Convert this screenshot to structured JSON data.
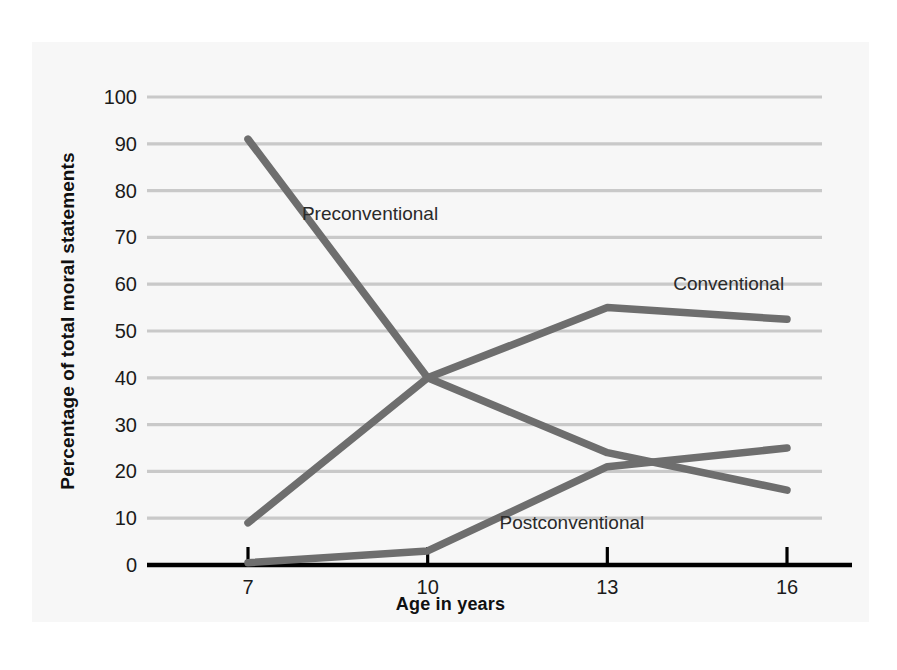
{
  "chart_data": {
    "type": "line",
    "title": "",
    "xlabel": "Age in years",
    "ylabel": "Percentage of total moral statements",
    "x": [
      7,
      10,
      13,
      16
    ],
    "xtick_labels": [
      "7",
      "10",
      "13",
      "16"
    ],
    "ytick_labels": [
      "0",
      "10",
      "20",
      "30",
      "40",
      "50",
      "60",
      "70",
      "80",
      "90",
      "100"
    ],
    "ytick_values": [
      0,
      10,
      20,
      30,
      40,
      50,
      60,
      70,
      80,
      90,
      100
    ],
    "ylim": [
      0,
      100
    ],
    "xlim": [
      7,
      16
    ],
    "grid": "horizontal",
    "legend_position": "inline-labels",
    "series": [
      {
        "name": "Preconventional",
        "values": [
          91,
          40,
          24,
          16
        ],
        "color": "#6e6e6e",
        "label_x": 7.9,
        "label_y": 75
      },
      {
        "name": "Conventional",
        "values": [
          9,
          40,
          55,
          52.5
        ],
        "color": "#6e6e6e",
        "label_x": 14.1,
        "label_y": 60
      },
      {
        "name": "Postconventional",
        "values": [
          0.5,
          3,
          21,
          25
        ],
        "color": "#6e6e6e",
        "label_x": 11.2,
        "label_y": 9
      }
    ]
  },
  "colors": {
    "line": "#6e6e6e",
    "gridline": "#c9c9c9",
    "axis": "#000000",
    "background": "#f7f7f7",
    "text": "#1b1b1b"
  },
  "axis": {
    "y_title": "Percentage of total moral statements",
    "x_title": "Age in years"
  },
  "ticks": {
    "y": [
      {
        "label": "100",
        "value": 100
      },
      {
        "label": "90",
        "value": 90
      },
      {
        "label": "80",
        "value": 80
      },
      {
        "label": "70",
        "value": 70
      },
      {
        "label": "60",
        "value": 60
      },
      {
        "label": "50",
        "value": 50
      },
      {
        "label": "40",
        "value": 40
      },
      {
        "label": "30",
        "value": 30
      },
      {
        "label": "20",
        "value": 20
      },
      {
        "label": "10",
        "value": 10
      },
      {
        "label": "0",
        "value": 0
      }
    ],
    "x": [
      {
        "label": "7",
        "value": 7
      },
      {
        "label": "10",
        "value": 10
      },
      {
        "label": "13",
        "value": 13
      },
      {
        "label": "16",
        "value": 16
      }
    ]
  },
  "series_labels": {
    "preconventional": "Preconventional",
    "conventional": "Conventional",
    "postconventional": "Postconventional"
  }
}
